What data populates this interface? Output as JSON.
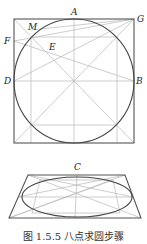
{
  "caption": "图 1.5.5  八点求圆步骤",
  "labels": {
    "A": "A",
    "B": "B",
    "C": "C",
    "D": "D",
    "E": "E",
    "F": "F",
    "G": "G",
    "M": "M"
  },
  "colors": {
    "outline": "#555555",
    "curve": "#444444",
    "construction": "#b8b8b8"
  },
  "figures": [
    {
      "name": "square-with-inscribed-circle",
      "description": "Square ABCD-frame with inscribed circle and construction lines"
    },
    {
      "name": "perspective-ellipse",
      "description": "Trapezoid (square in perspective) with inscribed ellipse via eight points"
    }
  ]
}
